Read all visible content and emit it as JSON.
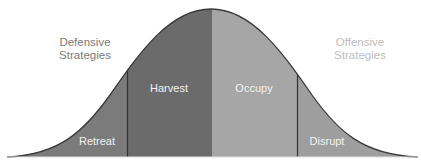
{
  "diagram": {
    "type": "bell-curve-segments",
    "left_label": {
      "line1": "Defensive",
      "line2": "Strategies"
    },
    "right_label": {
      "line1": "Offensive",
      "line2": "Strategies"
    },
    "segments": [
      {
        "id": "retreat",
        "label": "Retreat",
        "color": "#7b7b7b"
      },
      {
        "id": "harvest",
        "label": "Harvest",
        "color": "#6b6b6b"
      },
      {
        "id": "occupy",
        "label": "Occupy",
        "color": "#a6a6a6"
      },
      {
        "id": "disrupt",
        "label": "Disrupt",
        "color": "#9e9e9e"
      }
    ],
    "colors": {
      "outline": "#3a3a3a",
      "divider": "#333333",
      "defensive_text": "#7a7a7a",
      "offensive_text": "#bdbdbd",
      "segment_text": "#f2f2f2"
    }
  }
}
